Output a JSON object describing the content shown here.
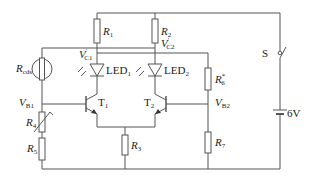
{
  "diagram": {
    "type": "circuit-schematic",
    "components": {
      "R1": {
        "label": "R",
        "sub": "1"
      },
      "R2": {
        "label": "R",
        "sub": "2"
      },
      "R3": {
        "label": "R",
        "sub": "3"
      },
      "R4": {
        "label": "R",
        "sub": "4",
        "kind": "variable"
      },
      "R5": {
        "label": "R",
        "sub": "5"
      },
      "R6": {
        "label": "R",
        "sub": "6",
        "sup": "*"
      },
      "R7": {
        "label": "R",
        "sub": "7"
      },
      "Rcds": {
        "label": "R",
        "sub": "cds",
        "kind": "photoresistor"
      },
      "LED1": {
        "label": "LED",
        "sub": "1"
      },
      "LED2": {
        "label": "LED",
        "sub": "2"
      },
      "T1": {
        "label": "T",
        "sub": "1"
      },
      "T2": {
        "label": "T",
        "sub": "2"
      },
      "S": {
        "label": "S"
      },
      "battery": {
        "label": "6V"
      }
    },
    "nodes": {
      "VC1": {
        "label": "V",
        "sub": "C1",
        "prime": "′"
      },
      "VC2": {
        "label": "V",
        "sub": "C2",
        "prime": "′"
      },
      "VB1": {
        "label": "V",
        "sub": "B1"
      },
      "VB2": {
        "label": "V",
        "sub": "B2"
      }
    },
    "colors": {
      "line": "#555555",
      "text": "#222222",
      "background": "#ffffff"
    }
  }
}
